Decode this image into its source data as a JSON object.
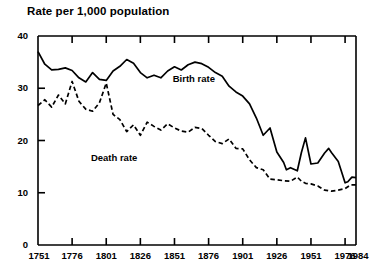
{
  "chart_data": {
    "type": "line",
    "title": "Rate per 1,000 population",
    "xlabel": "",
    "ylabel": "",
    "xlim": [
      1751,
      1984
    ],
    "ylim": [
      0,
      40
    ],
    "grid": false,
    "legend_position": "inline-annotation",
    "y_ticks": [
      0,
      10,
      20,
      30,
      40
    ],
    "x_ticks": [
      1751,
      1776,
      1801,
      1826,
      1851,
      1876,
      1901,
      1926,
      1951,
      1976,
      1984
    ],
    "y_tick_labels": [
      "0",
      "10",
      "20",
      "30",
      "40"
    ],
    "x_tick_labels": [
      "1751",
      "1776",
      "1801",
      "1826",
      "1851",
      "1876",
      "1901",
      "1926",
      "1951",
      "1976",
      "1984"
    ],
    "annotations": [
      {
        "text": "Birth rate",
        "x": 1860,
        "y": 31.5
      },
      {
        "text": "Death rate",
        "x": 1800,
        "y": 16.5
      }
    ],
    "series": [
      {
        "name": "Birth rate",
        "style": "solid",
        "color": "#000000",
        "x": [
          1751,
          1756,
          1761,
          1766,
          1771,
          1776,
          1781,
          1786,
          1791,
          1796,
          1801,
          1806,
          1811,
          1816,
          1821,
          1826,
          1831,
          1836,
          1841,
          1846,
          1851,
          1856,
          1861,
          1866,
          1871,
          1876,
          1881,
          1886,
          1891,
          1896,
          1901,
          1906,
          1911,
          1916,
          1921,
          1926,
          1931,
          1933,
          1936,
          1941,
          1944,
          1947,
          1951,
          1956,
          1961,
          1964,
          1966,
          1971,
          1976,
          1978,
          1981,
          1984
        ],
        "values": [
          37.0,
          34.6,
          33.5,
          33.6,
          33.9,
          33.4,
          32.0,
          31.2,
          33.0,
          31.7,
          31.5,
          33.3,
          34.2,
          35.5,
          34.8,
          33.0,
          32.0,
          32.5,
          32.0,
          33.3,
          34.1,
          33.5,
          34.5,
          35.0,
          34.7,
          34.0,
          33.0,
          32.3,
          30.4,
          29.3,
          28.5,
          27.0,
          24.3,
          21.0,
          22.4,
          17.8,
          15.8,
          14.4,
          14.8,
          14.2,
          17.7,
          20.5,
          15.5,
          15.7,
          17.6,
          18.5,
          17.7,
          16.0,
          11.9,
          12.1,
          13.0,
          12.9
        ]
      },
      {
        "name": "Death rate",
        "style": "dashed",
        "color": "#000000",
        "x": [
          1751,
          1756,
          1761,
          1766,
          1771,
          1776,
          1781,
          1786,
          1791,
          1796,
          1801,
          1806,
          1811,
          1816,
          1821,
          1826,
          1831,
          1836,
          1841,
          1846,
          1851,
          1856,
          1861,
          1866,
          1871,
          1876,
          1881,
          1886,
          1891,
          1896,
          1901,
          1906,
          1911,
          1916,
          1921,
          1926,
          1931,
          1936,
          1941,
          1944,
          1947,
          1951,
          1956,
          1961,
          1966,
          1971,
          1976,
          1980,
          1984
        ],
        "values": [
          26.7,
          27.8,
          26.4,
          28.7,
          27.0,
          31.3,
          27.5,
          26.0,
          25.6,
          27.2,
          31.0,
          25.0,
          24.0,
          21.7,
          23.0,
          21.0,
          23.5,
          22.7,
          22.0,
          23.2,
          22.4,
          21.8,
          21.6,
          22.5,
          22.3,
          21.0,
          19.8,
          19.4,
          20.3,
          18.5,
          18.4,
          16.3,
          14.8,
          14.4,
          12.6,
          12.5,
          12.3,
          12.2,
          13.0,
          12.2,
          11.8,
          11.7,
          11.3,
          10.5,
          10.3,
          10.5,
          10.8,
          11.5,
          11.5
        ]
      }
    ]
  }
}
